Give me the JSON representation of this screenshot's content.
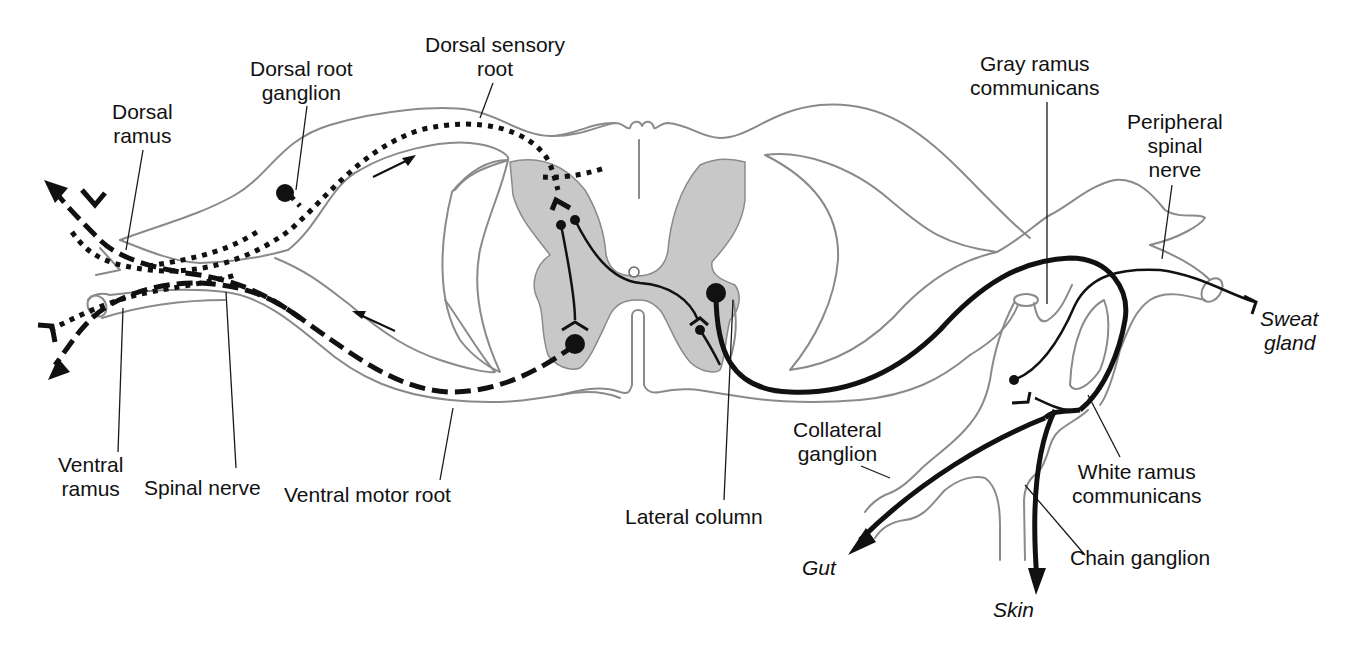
{
  "diagram": {
    "colors": {
      "outline": "#8a8a8a",
      "gray_matter": "#c8c8c8",
      "pathway": "#111111",
      "background": "#ffffff"
    },
    "labels": {
      "dorsal_ramus": [
        "Dorsal",
        "ramus"
      ],
      "dorsal_root_ganglion": [
        "Dorsal root",
        "ganglion"
      ],
      "dorsal_sensory_root": [
        "Dorsal sensory",
        "root"
      ],
      "gray_ramus_communicans": [
        "Gray ramus",
        "communicans"
      ],
      "peripheral_spinal_nerve": [
        "Peripheral",
        "spinal",
        "nerve"
      ],
      "sweat_gland": [
        "Sweat",
        "gland"
      ],
      "ventral_ramus": [
        "Ventral",
        "ramus"
      ],
      "spinal_nerve": [
        "Spinal nerve"
      ],
      "ventral_motor_root": [
        "Ventral motor root"
      ],
      "lateral_column": [
        "Lateral column"
      ],
      "collateral_ganglion": [
        "Collateral",
        "ganglion"
      ],
      "white_ramus_communicans": [
        "White ramus",
        "communicans"
      ],
      "chain_ganglion": [
        "Chain ganglion"
      ],
      "gut": [
        "Gut"
      ],
      "skin": [
        "Skin"
      ]
    },
    "pathway_legend": {
      "sensory": "dotted line (afferent)",
      "somatic_motor": "dashed line (efferent)",
      "autonomic": "solid line"
    }
  }
}
